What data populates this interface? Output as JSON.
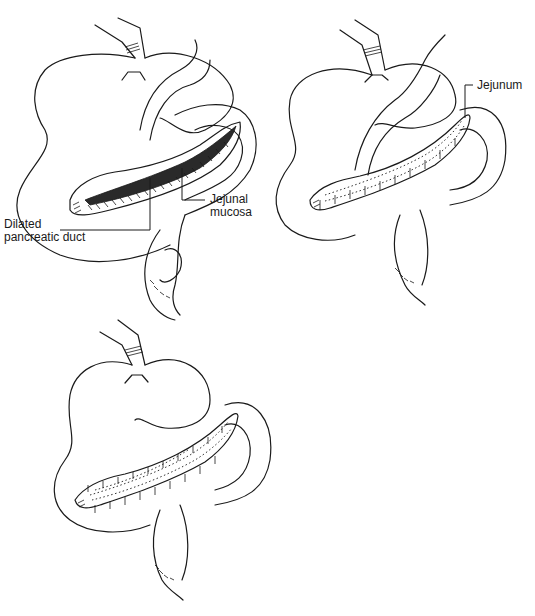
{
  "figure": {
    "panels": [
      {
        "id": "panel-a",
        "description": "Opened jejunal limb laid along the opened dilated pancreatic duct",
        "labels": [
          {
            "id": "dilated-pancreatic-duct",
            "line1": "Dilated",
            "line2": "pancreatic duct"
          },
          {
            "id": "jejunal-mucosa",
            "line1": "Jejunal",
            "line2": "mucosa"
          }
        ]
      },
      {
        "id": "panel-b",
        "description": "Posterior row of sutures anastomosing jejunum to pancreatic duct",
        "labels": [
          {
            "id": "jejunum",
            "line1": "Jejunum"
          }
        ]
      },
      {
        "id": "panel-c",
        "description": "Completed side-to-side pancreaticojejunostomy",
        "labels": []
      }
    ]
  }
}
